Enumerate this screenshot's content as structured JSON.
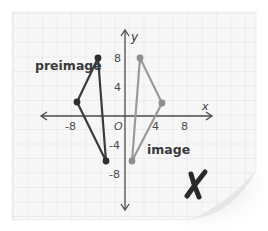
{
  "figure": {
    "type": "coordinate-graph-reflection",
    "axes": {
      "x_label": "x",
      "y_label": "y",
      "origin_label": "O",
      "x_ticks": [
        {
          "value": -8,
          "label": "-8"
        },
        {
          "value": 4,
          "label": "4"
        },
        {
          "value": 8,
          "label": "8"
        }
      ],
      "y_ticks": [
        {
          "value": 8,
          "label": "8"
        },
        {
          "value": 4,
          "label": "4"
        },
        {
          "value": -4,
          "label": "-4"
        },
        {
          "value": -8,
          "label": "-8"
        }
      ]
    },
    "preimage": {
      "label": "preimage",
      "color": "#3b3b3b",
      "vertices": [
        [
          -3.7,
          8
        ],
        [
          -6.6,
          2
        ],
        [
          -2.6,
          -6
        ]
      ]
    },
    "image": {
      "label": "image",
      "color": "#9a9a9a",
      "vertices": [
        [
          2,
          8
        ],
        [
          5,
          2
        ],
        [
          1,
          -6
        ]
      ]
    },
    "mark": {
      "symbol": "X",
      "meaning": "incorrect",
      "color": "#2a2a2a"
    }
  }
}
